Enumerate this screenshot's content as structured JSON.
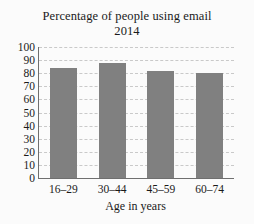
{
  "chart_data": {
    "type": "bar",
    "title": "Percentage of people using email",
    "subtitle": "2014",
    "title_lines": [
      "Percentage of people using email",
      "2014"
    ],
    "xlabel": "Age in years",
    "ylabel": "",
    "categories": [
      "16–29",
      "30–44",
      "45–59",
      "60–74"
    ],
    "values": [
      84,
      88,
      82,
      80
    ],
    "ylim": [
      0,
      100
    ],
    "ytick_values": [
      0,
      10,
      20,
      30,
      40,
      50,
      60,
      70,
      80,
      90,
      100
    ],
    "ytick_labels": [
      "0",
      "10",
      "20",
      "30",
      "40",
      "50",
      "60",
      "70",
      "80",
      "90",
      "100"
    ],
    "grid": true,
    "grid_axis": "y",
    "grid_style": "dashed",
    "legend": false,
    "legend_position": "none",
    "bar_color": "#808080",
    "grid_color": "#c9c9c9",
    "axis_color": "#6f6f6f",
    "background_color": "#fbfbfb",
    "text_color": "#1a1a1a"
  }
}
